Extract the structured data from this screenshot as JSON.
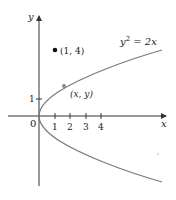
{
  "diagram": {
    "type": "parabola-plot",
    "equation": {
      "lhs_base": "y",
      "lhs_exp": "2",
      "rhs": " = 2x"
    },
    "axes": {
      "x_label": "x",
      "y_label": "y",
      "origin_label": "0"
    },
    "x_ticks": [
      "1",
      "2",
      "3",
      "4"
    ],
    "y_ticks": [
      "1"
    ],
    "points": [
      {
        "label": "(1, 4)",
        "x": 1,
        "y": 4,
        "style": "filled-black"
      },
      {
        "label": "(x, y)",
        "x": 1.5,
        "y": 1.73,
        "style": "gray-on-curve"
      }
    ],
    "curve": {
      "description": "y^2 = 2x, opening right",
      "x_range": [
        0,
        8
      ]
    },
    "colors": {
      "curve": "#7a7a7a",
      "axis": "#333333",
      "point_fixed": "#111111",
      "point_curve": "#8a8a8a"
    }
  }
}
